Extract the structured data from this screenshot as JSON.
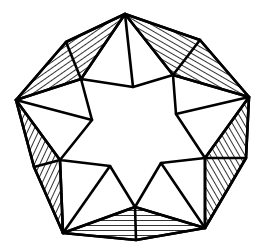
{
  "figure": {
    "title": "Heptagonal star tiling with hatched kite regions",
    "stroke_color": "#000000",
    "background": "#ffffff",
    "hatch_regions": [
      {
        "name": "top-left",
        "points": [
          [
            125,
            14
          ],
          [
            66,
            42
          ],
          [
            16,
            100
          ],
          [
            81,
            79
          ]
        ],
        "angle": -35
      },
      {
        "name": "top-right",
        "points": [
          [
            125,
            14
          ],
          [
            200,
            40
          ],
          [
            249,
            97
          ],
          [
            173,
            75
          ]
        ],
        "angle": 30
      },
      {
        "name": "right",
        "points": [
          [
            249,
            97
          ],
          [
            246,
            158
          ],
          [
            205,
            228
          ],
          [
            205,
            158
          ]
        ],
        "angle": 60
      },
      {
        "name": "bottom",
        "points": [
          [
            205,
            228
          ],
          [
            136,
            240
          ],
          [
            63,
            233
          ],
          [
            135,
            207
          ]
        ],
        "angle": 0
      },
      {
        "name": "left",
        "points": [
          [
            63,
            233
          ],
          [
            34,
            167
          ],
          [
            16,
            100
          ],
          [
            60,
            160
          ]
        ],
        "angle": -65
      }
    ],
    "star_outline": [
      [
        81,
        79
      ],
      [
        133,
        87
      ],
      [
        173,
        75
      ],
      [
        176,
        114
      ],
      [
        205,
        158
      ],
      [
        161,
        163
      ],
      [
        135,
        207
      ],
      [
        110,
        166
      ],
      [
        60,
        160
      ],
      [
        92,
        120
      ]
    ],
    "outer_outline": [
      [
        125,
        14
      ],
      [
        200,
        40
      ],
      [
        249,
        97
      ],
      [
        246,
        158
      ],
      [
        205,
        228
      ],
      [
        136,
        240
      ],
      [
        63,
        233
      ],
      [
        34,
        167
      ],
      [
        16,
        100
      ],
      [
        66,
        42
      ]
    ],
    "spokes": [
      [
        [
          125,
          14
        ],
        [
          133,
          87
        ]
      ],
      [
        [
          125,
          14
        ],
        [
          81,
          79
        ]
      ],
      [
        [
          125,
          14
        ],
        [
          173,
          75
        ]
      ],
      [
        [
          66,
          42
        ],
        [
          81,
          79
        ]
      ],
      [
        [
          200,
          40
        ],
        [
          173,
          75
        ]
      ],
      [
        [
          16,
          100
        ],
        [
          81,
          79
        ]
      ],
      [
        [
          16,
          100
        ],
        [
          92,
          120
        ]
      ],
      [
        [
          16,
          100
        ],
        [
          60,
          160
        ]
      ],
      [
        [
          249,
          97
        ],
        [
          173,
          75
        ]
      ],
      [
        [
          249,
          97
        ],
        [
          176,
          114
        ]
      ],
      [
        [
          249,
          97
        ],
        [
          205,
          158
        ]
      ],
      [
        [
          246,
          158
        ],
        [
          205,
          158
        ]
      ],
      [
        [
          205,
          228
        ],
        [
          205,
          158
        ]
      ],
      [
        [
          205,
          228
        ],
        [
          161,
          163
        ]
      ],
      [
        [
          205,
          228
        ],
        [
          135,
          207
        ]
      ],
      [
        [
          136,
          240
        ],
        [
          135,
          207
        ]
      ],
      [
        [
          63,
          233
        ],
        [
          135,
          207
        ]
      ],
      [
        [
          63,
          233
        ],
        [
          110,
          166
        ]
      ],
      [
        [
          63,
          233
        ],
        [
          60,
          160
        ]
      ],
      [
        [
          34,
          167
        ],
        [
          60,
          160
        ]
      ]
    ]
  }
}
